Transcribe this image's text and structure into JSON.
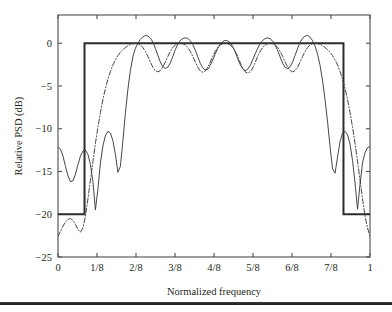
{
  "figure": {
    "name": "relative-psd-spectral-mask-plot",
    "background_color": "#ffffff",
    "axis_color": "#4d4d4d",
    "curve_color": "#3c3c3c",
    "mask_color": "#2b2b2b"
  },
  "chart_data": {
    "type": "line",
    "title": "",
    "xlabel": "Normalized frequency",
    "ylabel": "Relative PSD (dB)",
    "xlim": [
      0,
      1
    ],
    "ylim": [
      -25,
      3.3
    ],
    "grid": false,
    "legend_position": "none",
    "xticks": [
      0,
      0.125,
      0.25,
      0.375,
      0.5,
      0.625,
      0.75,
      0.875,
      1
    ],
    "xtick_labels": [
      "0",
      "1/8",
      "2/8",
      "3/8",
      "4/8",
      "5/8",
      "6/8",
      "7/8",
      "1"
    ],
    "yticks": [
      0,
      -5,
      -10,
      -15,
      -20,
      -25
    ],
    "ytick_labels": [
      "0",
      "-5",
      "-10",
      "-15",
      "-20",
      "-25"
    ],
    "series": [
      {
        "name": "spectral-mask",
        "style": "solid-thick",
        "description": "Spectral emission mask: 0 dB across passband, -20 dB in stopbands",
        "x": [
          0.0,
          0.085,
          0.085,
          0.915,
          0.915,
          1.0
        ],
        "y": [
          -20.0,
          -20.0,
          0.0,
          0.0,
          -20.0,
          -20.0
        ]
      },
      {
        "name": "psd-solid",
        "style": "solid",
        "description": "Power spectral density, solid curve with 5 passband ripples peaking near +0.9 dB and stopband sidelobes",
        "x": [
          0.0,
          0.008,
          0.016,
          0.024,
          0.032,
          0.04,
          0.048,
          0.056,
          0.064,
          0.072,
          0.08,
          0.088,
          0.096,
          0.104,
          0.112,
          0.12,
          0.128,
          0.136,
          0.144,
          0.152,
          0.16,
          0.168,
          0.176,
          0.184,
          0.192,
          0.2,
          0.208,
          0.216,
          0.224,
          0.232,
          0.24,
          0.248,
          0.256,
          0.264,
          0.272,
          0.28,
          0.288,
          0.296,
          0.304,
          0.312,
          0.32,
          0.328,
          0.336,
          0.344,
          0.352,
          0.36,
          0.368,
          0.376,
          0.384,
          0.392,
          0.4,
          0.408,
          0.416,
          0.424,
          0.432,
          0.44,
          0.448,
          0.456,
          0.464,
          0.472,
          0.48,
          0.488,
          0.496,
          0.504,
          0.512,
          0.52,
          0.528,
          0.536,
          0.544,
          0.552,
          0.56,
          0.568,
          0.576,
          0.584,
          0.592,
          0.6,
          0.608,
          0.616,
          0.624,
          0.632,
          0.64,
          0.648,
          0.656,
          0.664,
          0.672,
          0.68,
          0.688,
          0.696,
          0.704,
          0.712,
          0.72,
          0.728,
          0.736,
          0.744,
          0.752,
          0.76,
          0.768,
          0.776,
          0.784,
          0.792,
          0.8,
          0.808,
          0.816,
          0.824,
          0.832,
          0.84,
          0.848,
          0.856,
          0.864,
          0.872,
          0.88,
          0.888,
          0.896,
          0.904,
          0.912,
          0.92,
          0.928,
          0.936,
          0.944,
          0.952,
          0.96,
          0.968,
          0.976,
          0.984,
          0.992,
          1.0
        ],
        "y": [
          -12.1,
          -12.4,
          -13.2,
          -14.4,
          -15.5,
          -16.2,
          -16.1,
          -15.3,
          -14.2,
          -13.2,
          -12.6,
          -12.5,
          -13.0,
          -14.2,
          -16.2,
          -19.5,
          -17.0,
          -14.0,
          -12.0,
          -10.8,
          -10.3,
          -10.5,
          -11.4,
          -13.0,
          -15.1,
          -14.4,
          -11.4,
          -8.2,
          -5.4,
          -3.2,
          -1.6,
          -0.6,
          0.0,
          0.45,
          0.75,
          0.9,
          0.85,
          0.6,
          0.15,
          -0.6,
          -1.4,
          -2.2,
          -2.75,
          -2.95,
          -2.8,
          -2.3,
          -1.55,
          -0.75,
          -0.1,
          0.32,
          0.55,
          0.63,
          0.55,
          0.3,
          -0.15,
          -0.8,
          -1.6,
          -2.35,
          -2.9,
          -3.15,
          -3.05,
          -2.6,
          -1.95,
          -1.25,
          -0.6,
          -0.1,
          0.2,
          0.33,
          0.28,
          0.05,
          -0.4,
          -1.0,
          -1.8,
          -2.5,
          -3.0,
          -3.2,
          -3.05,
          -2.6,
          -1.95,
          -1.25,
          -0.6,
          -0.05,
          0.32,
          0.55,
          0.62,
          0.52,
          0.25,
          -0.2,
          -0.85,
          -1.6,
          -2.35,
          -2.85,
          -2.95,
          -2.75,
          -2.2,
          -1.4,
          -0.6,
          0.1,
          0.6,
          0.85,
          0.9,
          0.7,
          0.3,
          -0.35,
          -1.3,
          -2.6,
          -4.4,
          -6.6,
          -9.2,
          -12.1,
          -14.7,
          -15.2,
          -13.3,
          -11.5,
          -10.5,
          -10.3,
          -10.7,
          -11.8,
          -13.7,
          -16.3,
          -19.4,
          -16.5,
          -14.0,
          -12.8,
          -12.2,
          -12.1
        ]
      },
      {
        "name": "psd-dashdot",
        "style": "dashdot",
        "description": "Second power spectral density, dash-dot curve; wider main lobe roll-off, stopband floor near -22.5 dB",
        "x": [
          0.0,
          0.008,
          0.016,
          0.024,
          0.032,
          0.04,
          0.048,
          0.056,
          0.064,
          0.072,
          0.08,
          0.088,
          0.096,
          0.104,
          0.112,
          0.12,
          0.128,
          0.136,
          0.144,
          0.152,
          0.16,
          0.168,
          0.176,
          0.184,
          0.192,
          0.2,
          0.208,
          0.216,
          0.224,
          0.232,
          0.24,
          0.248,
          0.256,
          0.264,
          0.272,
          0.28,
          0.288,
          0.296,
          0.304,
          0.312,
          0.32,
          0.328,
          0.336,
          0.344,
          0.352,
          0.36,
          0.368,
          0.376,
          0.384,
          0.392,
          0.4,
          0.408,
          0.416,
          0.424,
          0.432,
          0.44,
          0.448,
          0.456,
          0.464,
          0.472,
          0.48,
          0.488,
          0.496,
          0.504,
          0.512,
          0.52,
          0.528,
          0.536,
          0.544,
          0.552,
          0.56,
          0.568,
          0.576,
          0.584,
          0.592,
          0.6,
          0.608,
          0.616,
          0.624,
          0.632,
          0.64,
          0.648,
          0.656,
          0.664,
          0.672,
          0.68,
          0.688,
          0.696,
          0.704,
          0.712,
          0.72,
          0.728,
          0.736,
          0.744,
          0.752,
          0.76,
          0.768,
          0.776,
          0.784,
          0.792,
          0.8,
          0.808,
          0.816,
          0.824,
          0.832,
          0.84,
          0.848,
          0.856,
          0.864,
          0.872,
          0.88,
          0.888,
          0.896,
          0.904,
          0.912,
          0.92,
          0.928,
          0.936,
          0.944,
          0.952,
          0.96,
          0.968,
          0.976,
          0.984,
          0.992,
          1.0
        ],
        "y": [
          -22.6,
          -22.0,
          -21.4,
          -20.9,
          -20.6,
          -20.5,
          -20.7,
          -21.2,
          -21.8,
          -22.1,
          -21.6,
          -20.2,
          -18.2,
          -16.0,
          -13.8,
          -11.7,
          -9.8,
          -8.1,
          -6.6,
          -5.3,
          -4.2,
          -3.3,
          -2.55,
          -1.95,
          -1.45,
          -1.05,
          -0.75,
          -0.5,
          -0.3,
          -0.15,
          -0.05,
          0.0,
          -0.05,
          -0.2,
          -0.5,
          -0.95,
          -1.55,
          -2.2,
          -2.8,
          -3.2,
          -3.35,
          -3.2,
          -2.8,
          -2.2,
          -1.55,
          -0.95,
          -0.5,
          -0.2,
          -0.05,
          0.0,
          -0.05,
          -0.2,
          -0.5,
          -0.95,
          -1.55,
          -2.2,
          -2.8,
          -3.25,
          -3.4,
          -3.25,
          -2.8,
          -2.2,
          -1.55,
          -0.95,
          -0.5,
          -0.2,
          -0.05,
          0.0,
          -0.05,
          -0.2,
          -0.5,
          -0.95,
          -1.55,
          -2.25,
          -2.9,
          -3.35,
          -3.5,
          -3.35,
          -2.9,
          -2.25,
          -1.55,
          -0.95,
          -0.5,
          -0.2,
          -0.05,
          0.0,
          -0.05,
          -0.2,
          -0.5,
          -0.95,
          -1.55,
          -2.2,
          -2.8,
          -3.2,
          -3.35,
          -3.2,
          -2.8,
          -2.2,
          -1.55,
          -0.95,
          -0.5,
          -0.2,
          -0.05,
          0.0,
          -0.05,
          -0.15,
          -0.3,
          -0.5,
          -0.75,
          -1.05,
          -1.45,
          -1.95,
          -2.55,
          -3.3,
          -4.2,
          -5.3,
          -6.6,
          -8.1,
          -9.8,
          -11.7,
          -13.8,
          -16.0,
          -18.2,
          -20.2,
          -21.6,
          -22.6
        ]
      }
    ]
  }
}
